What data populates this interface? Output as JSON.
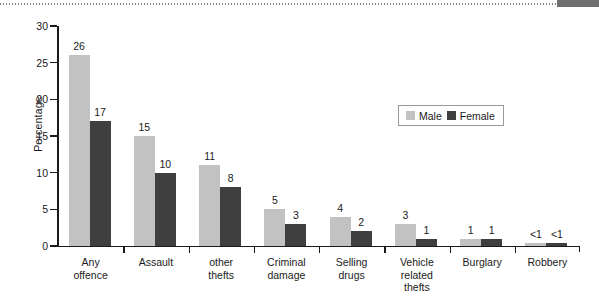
{
  "chart_data": {
    "type": "bar",
    "title": "",
    "xlabel": "",
    "ylabel": "Percentage",
    "ylim": [
      0,
      30
    ],
    "yticks": [
      0,
      5,
      10,
      15,
      20,
      25,
      30
    ],
    "ytick_labels": [
      "0",
      "5",
      "10",
      "15",
      "20",
      "25",
      "30"
    ],
    "grid": false,
    "legend_position": "upper right",
    "categories": [
      "Any offence",
      "Assault",
      "other thefts",
      "Criminal damage",
      "Selling drugs",
      "Vehicle related thefts",
      "Burglary",
      "Robbery"
    ],
    "category_lines": [
      [
        "Any",
        "offence"
      ],
      [
        "Assault"
      ],
      [
        "other",
        "thefts"
      ],
      [
        "Criminal",
        "damage"
      ],
      [
        "Selling",
        "drugs"
      ],
      [
        "Vehicle",
        "related",
        "thefts"
      ],
      [
        "Burglary"
      ],
      [
        "Robbery"
      ]
    ],
    "series": [
      {
        "name": "Male",
        "color": "#c2c2c2",
        "values": [
          26,
          15,
          11,
          5,
          4,
          3,
          1,
          0.4
        ],
        "labels": [
          "26",
          "15",
          "11",
          "5",
          "4",
          "3",
          "1",
          "<1"
        ]
      },
      {
        "name": "Female",
        "color": "#3f3f3f",
        "values": [
          17,
          10,
          8,
          3,
          2,
          1,
          1,
          0.4
        ],
        "labels": [
          "17",
          "10",
          "8",
          "3",
          "2",
          "1",
          "1",
          "<1"
        ]
      }
    ]
  },
  "legend": {
    "entries": [
      {
        "label": "Male",
        "color": "#c2c2c2"
      },
      {
        "label": "Female",
        "color": "#3f3f3f"
      }
    ]
  },
  "colors": {
    "male_bar": "#c2c2c2",
    "female_bar": "#3f3f3f",
    "axis": "#1a1a1a",
    "background": "#ffffff"
  }
}
